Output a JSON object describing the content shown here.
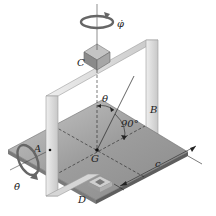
{
  "diagram": {
    "labels": {
      "phi_dot": "φ̇",
      "theta_dot": "θ̇",
      "C": "C",
      "B": "B",
      "A": "A",
      "G": "G",
      "D": "D",
      "theta": "θ",
      "angle": "90°",
      "c": "c"
    },
    "colors": {
      "plate_top": "#9a9a9a",
      "plate_edge": "#6e6e6e",
      "frame": "#d8d8d8",
      "frame_edge": "#9c9c9c",
      "bearing": "#8a8a8a",
      "line": "#222222"
    }
  }
}
